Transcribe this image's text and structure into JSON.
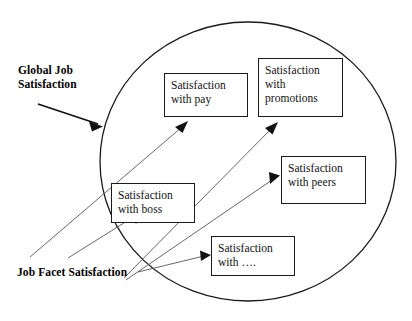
{
  "figure": {
    "type": "concept-diagram",
    "background_color": "#ffffff",
    "stroke_color": "#1a1a1a",
    "text_color": "#111111"
  },
  "labels": {
    "global": {
      "line1": "Global Job",
      "line2": "Satisfaction"
    },
    "facet": {
      "line1": "Job Facet Satisfaction"
    }
  },
  "nodes": [
    {
      "id": "pay",
      "line1": "Satisfaction",
      "line2": "with pay",
      "line3": ""
    },
    {
      "id": "promotions",
      "line1": "Satisfaction",
      "line2": "with",
      "line3": "promotions"
    },
    {
      "id": "peers",
      "line1": "Satisfaction",
      "line2": "with peers",
      "line3": ""
    },
    {
      "id": "boss",
      "line1": "Satisfaction",
      "line2": "with boss",
      "line3": ""
    },
    {
      "id": "other",
      "line1": "Satisfaction",
      "line2": "with ….",
      "line3": ""
    }
  ],
  "connectors": [
    {
      "id": "global-to-circle",
      "from": "Global Job Satisfaction",
      "to": "circle"
    },
    {
      "id": "facet-to-pay",
      "from": "Job Facet Satisfaction",
      "to": "Satisfaction with pay"
    },
    {
      "id": "facet-to-promotions",
      "from": "Job Facet Satisfaction",
      "to": "Satisfaction with promotions"
    },
    {
      "id": "facet-to-peers",
      "from": "Job Facet Satisfaction",
      "to": "Satisfaction with peers"
    },
    {
      "id": "facet-to-boss",
      "from": "Job Facet Satisfaction",
      "to": "Satisfaction with boss"
    },
    {
      "id": "facet-to-other",
      "from": "Job Facet Satisfaction",
      "to": "Satisfaction with …."
    }
  ]
}
